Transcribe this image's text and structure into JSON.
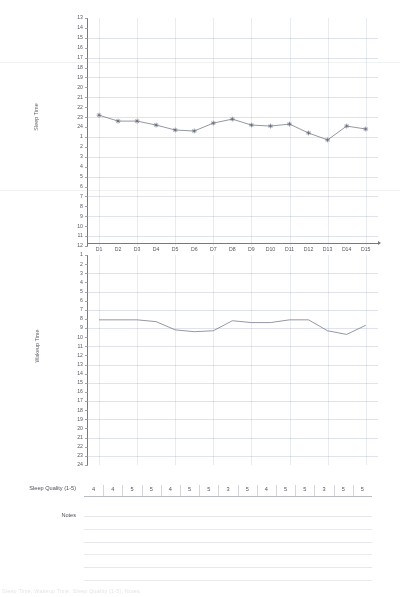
{
  "document": {
    "title": "Sleep Diary Chart",
    "footer_text": "Sleep Time, Wakeup Time, Sleep Quality (1-5), Notes"
  },
  "sleep_quality_row": {
    "label": "Sleep Quality (1-5)",
    "values": [
      "4",
      "4",
      "5",
      "5",
      "4",
      "5",
      "5",
      "3",
      "5",
      "4",
      "5",
      "5",
      "3",
      "5",
      "5"
    ]
  },
  "notes_row": {
    "label": "Notes",
    "line_count": 6
  },
  "chart_data": [
    {
      "type": "line",
      "name": "sleep-time-chart",
      "title": "",
      "ylabel": "Sleep Time",
      "xlabel": "",
      "grid": true,
      "legend": "none",
      "categories": [
        "D1",
        "D2",
        "D3",
        "D4",
        "D5",
        "D6",
        "D7",
        "D8",
        "D9",
        "D10",
        "D11",
        "D12",
        "D13",
        "D14",
        "D15"
      ],
      "ytick_labels": [
        "13",
        "14",
        "15",
        "16",
        "17",
        "18",
        "19",
        "20",
        "21",
        "22",
        "23",
        "24",
        "1",
        "2",
        "3",
        "4",
        "5",
        "6",
        "7",
        "8",
        "9",
        "10",
        "11",
        "12"
      ],
      "ylim": [
        13,
        37
      ],
      "yaxis_note": "clock hours 13..24 then 1..12, top to bottom",
      "values": [
        22.8,
        23.4,
        23.4,
        23.8,
        24.3,
        24.4,
        23.6,
        23.2,
        23.8,
        23.9,
        23.7,
        24.6,
        25.3,
        23.9,
        24.2
      ],
      "values_as_clock": [
        "22:50",
        "23:25",
        "23:25",
        "23:50",
        "00:20",
        "00:25",
        "23:35",
        "23:15",
        "23:50",
        "23:55",
        "23:40",
        "00:35",
        "01:20",
        "23:55",
        "00:10"
      ],
      "marker": "star"
    },
    {
      "type": "line",
      "name": "wakeup-time-chart",
      "title": "",
      "ylabel": "Wakeup Time",
      "xlabel": "",
      "grid": true,
      "legend": "none",
      "categories": [
        "D1",
        "D2",
        "D3",
        "D4",
        "D5",
        "D6",
        "D7",
        "D8",
        "D9",
        "D10",
        "D11",
        "D12",
        "D13",
        "D14",
        "D15"
      ],
      "ytick_labels": [
        "1",
        "2",
        "3",
        "4",
        "5",
        "6",
        "7",
        "8",
        "9",
        "10",
        "11",
        "12",
        "13",
        "14",
        "15",
        "16",
        "17",
        "18",
        "19",
        "20",
        "21",
        "22",
        "23",
        "24"
      ],
      "ylim": [
        1,
        24
      ],
      "values": [
        8.1,
        8.1,
        8.1,
        8.3,
        9.2,
        9.4,
        9.3,
        8.2,
        8.4,
        8.4,
        8.1,
        8.1,
        9.3,
        9.7,
        8.7
      ],
      "values_as_clock": [
        "08:05",
        "08:05",
        "08:05",
        "08:20",
        "09:10",
        "09:25",
        "09:20",
        "08:10",
        "08:25",
        "08:25",
        "08:05",
        "08:05",
        "09:20",
        "09:40",
        "08:40"
      ],
      "marker": "none"
    }
  ],
  "colors": {
    "ink": "#4a4e55",
    "axis": "#6f747d",
    "grid": "#96a0be",
    "series": "#5a6070",
    "paper": "#ffffff"
  }
}
